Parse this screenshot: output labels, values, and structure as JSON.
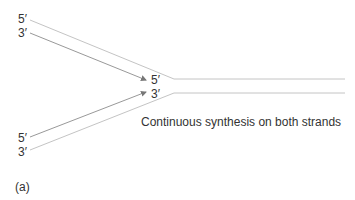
{
  "diagram": {
    "panel_label": "(a)",
    "caption": "Continuous synthesis on both strands",
    "labels": {
      "top_left_5": "5′",
      "top_left_3": "3′",
      "fork_5": "5′",
      "fork_3": "3′",
      "bottom_left_5": "5′",
      "bottom_left_3": "3′"
    },
    "colors": {
      "strand_line": "#bdbdbd",
      "arrow_line": "#888888",
      "text": "#333333"
    }
  }
}
